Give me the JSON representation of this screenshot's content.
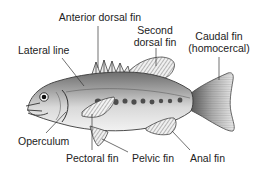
{
  "diagram": {
    "colors": {
      "background": "#ffffff",
      "text": "#222222",
      "leader_line": "#333333",
      "body_light": "#e6e6e6",
      "body_dark": "#7a7a7a",
      "spots": "#555555"
    },
    "labels": {
      "anterior_dorsal_fin": "Anterior dorsal fin",
      "second_dorsal_fin_line1": "Second",
      "second_dorsal_fin_line2": "dorsal fin",
      "caudal_fin_line1": "Caudal fin",
      "caudal_fin_line2": "(homocercal)",
      "lateral_line": "Lateral line",
      "operculum": "Operculum",
      "pectoral_fin": "Pectoral fin",
      "pelvic_fin": "Pelvic fin",
      "anal_fin": "Anal fin"
    }
  }
}
